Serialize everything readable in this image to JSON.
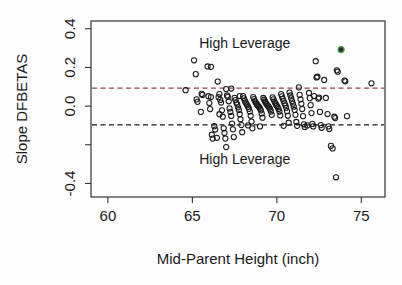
{
  "chart_data": {
    "type": "scatter",
    "title": "",
    "xlabel": "Mid-Parent Height (inch)",
    "ylabel": "Slope DFBETAS",
    "xlim": [
      59.0,
      76.4
    ],
    "ylim": [
      -0.47,
      0.44
    ],
    "xticks": [
      60,
      65,
      70,
      75
    ],
    "xtick_labels": [
      "60",
      "65",
      "70",
      "75"
    ],
    "yticks": [
      0.4,
      0.2,
      0.0,
      -0.2,
      -0.4
    ],
    "ytick_labels": [
      "0.4",
      "0.2",
      "0.0",
      "",
      "-0.4"
    ],
    "grid": false,
    "legend": false,
    "annotations": [
      {
        "text": "High Leverage",
        "x": 68.1,
        "y": 0.325
      },
      {
        "text": "High Leverage",
        "x": 68.1,
        "y": -0.275
      }
    ],
    "reference_lines": [
      {
        "y": 0.093,
        "style": "dashed",
        "color": "#8a4a4a",
        "label": "upper cutoff"
      },
      {
        "y": -0.097,
        "style": "dashed",
        "color": "#1a1a1a",
        "label": "lower cutoff"
      }
    ],
    "series": [
      {
        "name": "DFBETAS",
        "marker": "open-circle",
        "color": "#1b1b1b",
        "points": [
          [
            64.6,
            0.082
          ],
          [
            65.1,
            0.237
          ],
          [
            65.2,
            0.165
          ],
          [
            65.25,
            0.035
          ],
          [
            65.3,
            0.022
          ],
          [
            65.55,
            0.063
          ],
          [
            65.6,
            0.058
          ],
          [
            65.9,
            0.205
          ],
          [
            66.1,
            0.203
          ],
          [
            65.95,
            0.051
          ],
          [
            66.0,
            0.016
          ],
          [
            66.05,
            -0.015
          ],
          [
            66.15,
            -0.148
          ],
          [
            66.2,
            -0.168
          ],
          [
            66.3,
            -0.104
          ],
          [
            66.35,
            -0.121
          ],
          [
            66.45,
            -0.164
          ],
          [
            66.5,
            0.127
          ],
          [
            66.55,
            0.046
          ],
          [
            66.6,
            0.062
          ],
          [
            66.65,
            0.032
          ],
          [
            66.7,
            0.018
          ],
          [
            66.75,
            -0.022
          ],
          [
            66.8,
            -0.055
          ],
          [
            66.85,
            -0.115
          ],
          [
            66.9,
            -0.139
          ],
          [
            66.95,
            -0.168
          ],
          [
            67.0,
            -0.212
          ],
          [
            67.05,
            0.055
          ],
          [
            67.1,
            0.048
          ],
          [
            67.15,
            0.025
          ],
          [
            67.2,
            -0.012
          ],
          [
            67.25,
            -0.03
          ],
          [
            67.3,
            -0.051
          ],
          [
            67.35,
            -0.09
          ],
          [
            67.4,
            -0.12
          ],
          [
            67.45,
            -0.16
          ],
          [
            67.5,
            0.043
          ],
          [
            67.55,
            0.031
          ],
          [
            67.6,
            0.018
          ],
          [
            67.65,
            0.009
          ],
          [
            67.7,
            -0.006
          ],
          [
            67.75,
            -0.02
          ],
          [
            67.8,
            -0.042
          ],
          [
            67.85,
            -0.068
          ],
          [
            67.9,
            -0.098
          ],
          [
            67.95,
            -0.135
          ],
          [
            68.0,
            0.052
          ],
          [
            68.05,
            0.04
          ],
          [
            68.1,
            0.028
          ],
          [
            68.15,
            0.019
          ],
          [
            68.2,
            0.012
          ],
          [
            68.25,
            0.004
          ],
          [
            68.3,
            -0.004
          ],
          [
            68.35,
            -0.014
          ],
          [
            68.4,
            -0.028
          ],
          [
            68.45,
            -0.05
          ],
          [
            68.5,
            -0.08
          ],
          [
            68.55,
            -0.115
          ],
          [
            68.6,
            0.047
          ],
          [
            68.65,
            0.036
          ],
          [
            68.7,
            0.026
          ],
          [
            68.75,
            0.018
          ],
          [
            68.8,
            0.011
          ],
          [
            68.85,
            0.005
          ],
          [
            68.9,
            0.0
          ],
          [
            68.95,
            -0.005
          ],
          [
            69.0,
            -0.012
          ],
          [
            69.05,
            -0.022
          ],
          [
            69.1,
            -0.038
          ],
          [
            69.15,
            -0.06
          ],
          [
            69.2,
            0.042
          ],
          [
            69.25,
            0.033
          ],
          [
            69.3,
            0.024
          ],
          [
            69.35,
            0.016
          ],
          [
            69.4,
            0.009
          ],
          [
            69.45,
            0.003
          ],
          [
            69.5,
            -0.002
          ],
          [
            69.55,
            -0.008
          ],
          [
            69.6,
            -0.016
          ],
          [
            69.65,
            -0.028
          ],
          [
            69.7,
            -0.045
          ],
          [
            69.75,
            0.045
          ],
          [
            69.8,
            0.035
          ],
          [
            69.85,
            0.025
          ],
          [
            69.9,
            0.016
          ],
          [
            69.95,
            0.008
          ],
          [
            70.0,
            0.001
          ],
          [
            70.05,
            -0.006
          ],
          [
            70.1,
            -0.015
          ],
          [
            70.15,
            -0.028
          ],
          [
            70.2,
            -0.048
          ],
          [
            70.25,
            0.062
          ],
          [
            70.3,
            0.05
          ],
          [
            70.35,
            0.038
          ],
          [
            70.4,
            0.026
          ],
          [
            70.45,
            0.014
          ],
          [
            70.5,
            0.004
          ],
          [
            70.55,
            -0.009
          ],
          [
            70.6,
            -0.026
          ],
          [
            70.65,
            -0.05
          ],
          [
            70.7,
            -0.086
          ],
          [
            70.75,
            0.07
          ],
          [
            70.8,
            0.055
          ],
          [
            70.85,
            0.04
          ],
          [
            70.9,
            0.026
          ],
          [
            70.95,
            0.012
          ],
          [
            71.0,
            -0.003
          ],
          [
            71.05,
            -0.02
          ],
          [
            71.1,
            -0.045
          ],
          [
            71.15,
            -0.082
          ],
          [
            71.2,
            -0.102
          ],
          [
            71.3,
            0.097
          ],
          [
            71.35,
            0.058
          ],
          [
            71.4,
            0.035
          ],
          [
            71.45,
            0.012
          ],
          [
            71.5,
            -0.015
          ],
          [
            71.55,
            -0.052
          ],
          [
            71.6,
            -0.094
          ],
          [
            71.65,
            -0.108
          ],
          [
            71.9,
            0.068
          ],
          [
            71.95,
            0.041
          ],
          [
            72.0,
            0.005
          ],
          [
            72.05,
            -0.036
          ],
          [
            72.1,
            -0.092
          ],
          [
            72.15,
            -0.105
          ],
          [
            72.3,
            0.232
          ],
          [
            72.35,
            0.148
          ],
          [
            72.4,
            0.152
          ],
          [
            72.45,
            0.039
          ],
          [
            72.5,
            0.044
          ],
          [
            72.55,
            -0.03
          ],
          [
            72.6,
            -0.098
          ],
          [
            72.65,
            -0.112
          ],
          [
            72.8,
            0.135
          ],
          [
            72.9,
            0.042
          ],
          [
            73.0,
            -0.041
          ],
          [
            73.05,
            -0.105
          ],
          [
            73.1,
            -0.118
          ],
          [
            73.2,
            -0.206
          ],
          [
            73.3,
            -0.219
          ],
          [
            73.4,
            -0.055
          ],
          [
            73.45,
            -0.062
          ],
          [
            73.55,
            0.185
          ],
          [
            73.6,
            0.178
          ],
          [
            73.8,
            0.292
          ],
          [
            74.0,
            0.132
          ],
          [
            74.05,
            0.128
          ],
          [
            74.15,
            -0.052
          ],
          [
            73.5,
            -0.368
          ],
          [
            75.6,
            0.118
          ],
          [
            66.6,
            -0.042
          ],
          [
            67.0,
            0.088
          ],
          [
            67.3,
            0.091
          ],
          [
            65.5,
            -0.03
          ],
          [
            66.1,
            0.047
          ],
          [
            71.8,
            -0.1
          ],
          [
            70.4,
            -0.102
          ],
          [
            69.0,
            -0.105
          ],
          [
            68.3,
            -0.1
          ],
          [
            67.8,
            0.052
          ],
          [
            72.2,
            0.052
          ]
        ]
      },
      {
        "name": "Highlighted observation",
        "marker": "filled-circle-green-ring",
        "color": "#4ea24e",
        "points": [
          [
            73.8,
            0.292
          ]
        ]
      }
    ]
  },
  "axis_labels": {
    "x_title": "Mid-Parent Height (inch)",
    "y_title": "Slope DFBETAS"
  }
}
